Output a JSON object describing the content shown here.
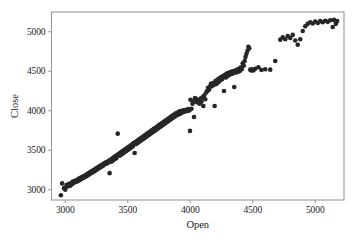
{
  "figure": {
    "background_color": "#ffffff",
    "frame_color": "#9a9a9a",
    "marker_color": "#262626",
    "text_color": "#1a1a1a"
  },
  "axes": {
    "x_title": "Open",
    "y_title": "Close",
    "x_ticks": [
      "3000",
      "3500",
      "4000",
      "4500",
      "5000"
    ],
    "y_ticks": [
      "3000",
      "3500",
      "4000",
      "4500",
      "5000"
    ]
  },
  "chart_data": {
    "type": "scatter",
    "title": "",
    "xlabel": "Open",
    "ylabel": "Close",
    "xticks": [
      3000,
      3500,
      4000,
      4500,
      5000
    ],
    "yticks": [
      3000,
      3500,
      4000,
      4500,
      5000
    ],
    "xlim": [
      2890,
      5230
    ],
    "ylim": [
      2870,
      5250
    ],
    "grid": false,
    "legend": null,
    "marker": "circle",
    "marker_size": 4.6,
    "marker_color": "#262626",
    "series": [
      {
        "name": "Open vs Close",
        "points": [
          [
            2965,
            2930
          ],
          [
            2975,
            3080
          ],
          [
            2990,
            3020
          ],
          [
            3000,
            3000
          ],
          [
            3010,
            3060
          ],
          [
            3020,
            3040
          ],
          [
            3030,
            3075
          ],
          [
            3040,
            3050
          ],
          [
            3050,
            3085
          ],
          [
            3055,
            3070
          ],
          [
            3060,
            3105
          ],
          [
            3068,
            3090
          ],
          [
            3075,
            3110
          ],
          [
            3080,
            3095
          ],
          [
            3088,
            3120
          ],
          [
            3095,
            3105
          ],
          [
            3100,
            3130
          ],
          [
            3105,
            3115
          ],
          [
            3110,
            3140
          ],
          [
            3118,
            3125
          ],
          [
            3122,
            3150
          ],
          [
            3128,
            3135
          ],
          [
            3135,
            3160
          ],
          [
            3140,
            3145
          ],
          [
            3145,
            3170
          ],
          [
            3150,
            3155
          ],
          [
            3158,
            3180
          ],
          [
            3162,
            3165
          ],
          [
            3168,
            3190
          ],
          [
            3172,
            3175
          ],
          [
            3178,
            3200
          ],
          [
            3182,
            3185
          ],
          [
            3188,
            3210
          ],
          [
            3192,
            3195
          ],
          [
            3198,
            3220
          ],
          [
            3202,
            3205
          ],
          [
            3208,
            3230
          ],
          [
            3212,
            3215
          ],
          [
            3218,
            3240
          ],
          [
            3222,
            3225
          ],
          [
            3228,
            3250
          ],
          [
            3232,
            3235
          ],
          [
            3238,
            3260
          ],
          [
            3242,
            3245
          ],
          [
            3248,
            3270
          ],
          [
            3252,
            3255
          ],
          [
            3258,
            3280
          ],
          [
            3262,
            3265
          ],
          [
            3268,
            3290
          ],
          [
            3272,
            3275
          ],
          [
            3278,
            3300
          ],
          [
            3282,
            3285
          ],
          [
            3288,
            3310
          ],
          [
            3292,
            3295
          ],
          [
            3298,
            3320
          ],
          [
            3302,
            3305
          ],
          [
            3308,
            3330
          ],
          [
            3315,
            3320
          ],
          [
            3322,
            3345
          ],
          [
            3328,
            3330
          ],
          [
            3335,
            3355
          ],
          [
            3342,
            3340
          ],
          [
            3348,
            3365
          ],
          [
            3355,
            3210
          ],
          [
            3360,
            3380
          ],
          [
            3368,
            3355
          ],
          [
            3375,
            3395
          ],
          [
            3382,
            3370
          ],
          [
            3388,
            3410
          ],
          [
            3395,
            3385
          ],
          [
            3402,
            3425
          ],
          [
            3408,
            3400
          ],
          [
            3415,
            3440
          ],
          [
            3420,
            3710
          ],
          [
            3428,
            3455
          ],
          [
            3435,
            3430
          ],
          [
            3442,
            3470
          ],
          [
            3448,
            3445
          ],
          [
            3455,
            3485
          ],
          [
            3462,
            3460
          ],
          [
            3468,
            3500
          ],
          [
            3475,
            3475
          ],
          [
            3482,
            3515
          ],
          [
            3488,
            3490
          ],
          [
            3495,
            3530
          ],
          [
            3502,
            3505
          ],
          [
            3508,
            3545
          ],
          [
            3515,
            3520
          ],
          [
            3522,
            3560
          ],
          [
            3528,
            3535
          ],
          [
            3535,
            3575
          ],
          [
            3542,
            3550
          ],
          [
            3548,
            3590
          ],
          [
            3555,
            3465
          ],
          [
            3562,
            3605
          ],
          [
            3568,
            3580
          ],
          [
            3575,
            3620
          ],
          [
            3582,
            3595
          ],
          [
            3588,
            3635
          ],
          [
            3595,
            3610
          ],
          [
            3602,
            3650
          ],
          [
            3608,
            3625
          ],
          [
            3615,
            3665
          ],
          [
            3622,
            3640
          ],
          [
            3628,
            3680
          ],
          [
            3635,
            3655
          ],
          [
            3642,
            3695
          ],
          [
            3648,
            3670
          ],
          [
            3655,
            3710
          ],
          [
            3662,
            3685
          ],
          [
            3668,
            3725
          ],
          [
            3675,
            3700
          ],
          [
            3682,
            3740
          ],
          [
            3688,
            3715
          ],
          [
            3695,
            3755
          ],
          [
            3702,
            3730
          ],
          [
            3708,
            3770
          ],
          [
            3715,
            3745
          ],
          [
            3722,
            3785
          ],
          [
            3728,
            3760
          ],
          [
            3735,
            3800
          ],
          [
            3742,
            3775
          ],
          [
            3748,
            3815
          ],
          [
            3755,
            3790
          ],
          [
            3762,
            3830
          ],
          [
            3768,
            3805
          ],
          [
            3775,
            3845
          ],
          [
            3782,
            3820
          ],
          [
            3788,
            3860
          ],
          [
            3795,
            3835
          ],
          [
            3802,
            3875
          ],
          [
            3808,
            3850
          ],
          [
            3815,
            3890
          ],
          [
            3822,
            3865
          ],
          [
            3828,
            3905
          ],
          [
            3835,
            3880
          ],
          [
            3842,
            3920
          ],
          [
            3848,
            3895
          ],
          [
            3855,
            3935
          ],
          [
            3862,
            3910
          ],
          [
            3868,
            3950
          ],
          [
            3875,
            3925
          ],
          [
            3882,
            3965
          ],
          [
            3888,
            3940
          ],
          [
            3895,
            3975
          ],
          [
            3902,
            3950
          ],
          [
            3908,
            3985
          ],
          [
            3915,
            3960
          ],
          [
            3922,
            3995
          ],
          [
            3928,
            3970
          ],
          [
            3935,
            4000
          ],
          [
            3942,
            3980
          ],
          [
            3948,
            4005
          ],
          [
            3955,
            3990
          ],
          [
            3962,
            4010
          ],
          [
            3968,
            3995
          ],
          [
            3975,
            4015
          ],
          [
            3982,
            4000
          ],
          [
            3988,
            4020
          ],
          [
            3995,
            4005
          ],
          [
            3998,
            3745
          ],
          [
            4002,
            4140
          ],
          [
            4010,
            4025
          ],
          [
            4018,
            4090
          ],
          [
            4025,
            4120
          ],
          [
            4030,
            3920
          ],
          [
            4038,
            4160
          ],
          [
            4045,
            4115
          ],
          [
            4052,
            4145
          ],
          [
            4060,
            4105
          ],
          [
            4068,
            4130
          ],
          [
            4075,
            4090
          ],
          [
            4082,
            4155
          ],
          [
            4090,
            4115
          ],
          [
            4098,
            4170
          ],
          [
            4105,
            4060
          ],
          [
            4112,
            4195
          ],
          [
            4120,
            4145
          ],
          [
            4128,
            4230
          ],
          [
            4135,
            4250
          ],
          [
            4142,
            4290
          ],
          [
            4150,
            4265
          ],
          [
            4158,
            4305
          ],
          [
            4165,
            4340
          ],
          [
            4172,
            4310
          ],
          [
            4180,
            4350
          ],
          [
            4188,
            4325
          ],
          [
            4195,
            4060
          ],
          [
            4202,
            4375
          ],
          [
            4210,
            4340
          ],
          [
            4218,
            4395
          ],
          [
            4225,
            4360
          ],
          [
            4232,
            4410
          ],
          [
            4240,
            4385
          ],
          [
            4248,
            4425
          ],
          [
            4255,
            4400
          ],
          [
            4262,
            4440
          ],
          [
            4270,
            4250
          ],
          [
            4278,
            4455
          ],
          [
            4285,
            4420
          ],
          [
            4292,
            4470
          ],
          [
            4300,
            4440
          ],
          [
            4308,
            4480
          ],
          [
            4315,
            4455
          ],
          [
            4322,
            4490
          ],
          [
            4330,
            4465
          ],
          [
            4338,
            4500
          ],
          [
            4345,
            4475
          ],
          [
            4352,
            4300
          ],
          [
            4360,
            4510
          ],
          [
            4368,
            4485
          ],
          [
            4375,
            4520
          ],
          [
            4382,
            4495
          ],
          [
            4390,
            4530
          ],
          [
            4398,
            4505
          ],
          [
            4405,
            4550
          ],
          [
            4412,
            4525
          ],
          [
            4420,
            4600
          ],
          [
            4428,
            4570
          ],
          [
            4435,
            4630
          ],
          [
            4442,
            4680
          ],
          [
            4450,
            4720
          ],
          [
            4458,
            4760
          ],
          [
            4465,
            4810
          ],
          [
            4472,
            4790
          ],
          [
            4480,
            4520
          ],
          [
            4488,
            4510
          ],
          [
            4495,
            4525
          ],
          [
            4505,
            4510
          ],
          [
            4520,
            4530
          ],
          [
            4545,
            4550
          ],
          [
            4570,
            4515
          ],
          [
            4600,
            4525
          ],
          [
            4640,
            4520
          ],
          [
            4680,
            4630
          ],
          [
            4720,
            4900
          ],
          [
            4740,
            4930
          ],
          [
            4760,
            4905
          ],
          [
            4780,
            4945
          ],
          [
            4800,
            4920
          ],
          [
            4820,
            4960
          ],
          [
            4840,
            4890
          ],
          [
            4860,
            4835
          ],
          [
            4880,
            4905
          ],
          [
            4900,
            5010
          ],
          [
            4920,
            5070
          ],
          [
            4940,
            5100
          ],
          [
            4960,
            5120
          ],
          [
            4980,
            5105
          ],
          [
            5000,
            5130
          ],
          [
            5020,
            5110
          ],
          [
            5040,
            5135
          ],
          [
            5060,
            5120
          ],
          [
            5080,
            5140
          ],
          [
            5100,
            5125
          ],
          [
            5120,
            5145
          ],
          [
            5140,
            5060
          ],
          [
            5150,
            5150
          ],
          [
            5165,
            5100
          ],
          [
            5175,
            5135
          ]
        ]
      }
    ]
  }
}
